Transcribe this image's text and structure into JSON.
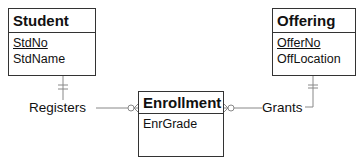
{
  "diagram": {
    "type": "ERD (crow's foot notation)",
    "entities": [
      {
        "name": "Student",
        "primary_key": "StdNo",
        "attributes": [
          "StdName"
        ]
      },
      {
        "name": "Offering",
        "primary_key": "OfferNo",
        "attributes": [
          "OffLocation"
        ]
      },
      {
        "name": "Enrollment",
        "primary_key": null,
        "attributes": [
          "EnrGrade"
        ],
        "weak": true
      }
    ],
    "relationships": [
      {
        "name": "Registers",
        "from": "Student",
        "to": "Enrollment",
        "from_cardinality": "one-and-only-one",
        "to_cardinality": "zero-or-many"
      },
      {
        "name": "Grants",
        "from": "Offering",
        "to": "Enrollment",
        "from_cardinality": "one-and-only-one",
        "to_cardinality": "zero-or-many"
      }
    ],
    "line_color": "#888888",
    "border_color": "#333333"
  }
}
